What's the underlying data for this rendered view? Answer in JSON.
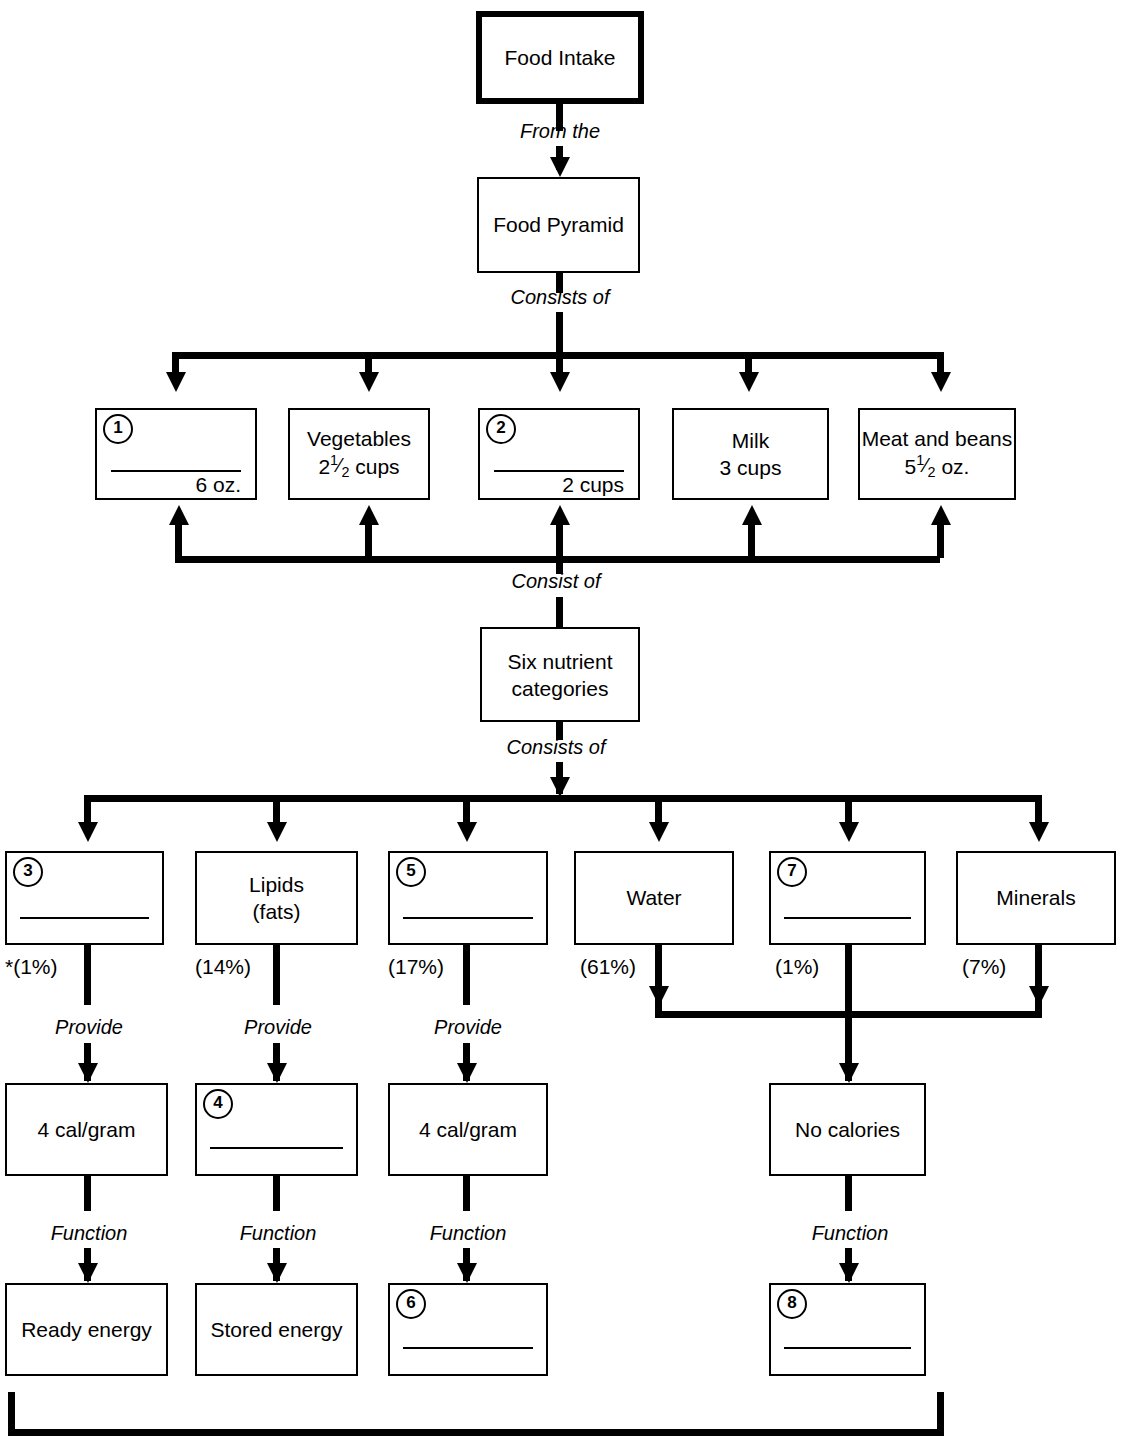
{
  "diagram": {
    "nodes": {
      "food_intake": "Food Intake",
      "food_pyramid": "Food Pyramid",
      "six_nutrient": "Six nutrient\ncategories",
      "six_nutrient_l1": "Six nutrient",
      "six_nutrient_l2": "categories"
    },
    "connector_labels": {
      "from_the": "From the",
      "consists_of_1": "Consists of",
      "consist_of_up": "Consist of",
      "consists_of_2": "Consists of",
      "provide_1": "Provide",
      "provide_2": "Provide",
      "provide_3": "Provide",
      "function_1": "Function",
      "function_2": "Function",
      "function_3": "Function",
      "function_4": "Function"
    },
    "food_groups": [
      {
        "num": "1",
        "label": "",
        "amount": "6 oz.",
        "blank": true
      },
      {
        "num": "",
        "label": "Vegetables",
        "amount": "2¹⁄₂ cups",
        "amount_whole": "2",
        "amount_num": "1",
        "amount_den": "2",
        "amount_unit": "cups",
        "blank": false
      },
      {
        "num": "2",
        "label": "",
        "amount": "2 cups",
        "blank": true
      },
      {
        "num": "",
        "label": "Milk",
        "amount": "3 cups",
        "blank": false
      },
      {
        "num": "",
        "label": "Meat and beans",
        "amount": "5¹⁄₂ oz.",
        "amount_whole": "5",
        "amount_num": "1",
        "amount_den": "2",
        "amount_unit": "oz.",
        "blank": false
      }
    ],
    "nutrients": [
      {
        "num": "3",
        "label": "",
        "label2": "",
        "percent": "*(1%)",
        "blank": true
      },
      {
        "num": "",
        "label": "Lipids",
        "label2": "(fats)",
        "percent": "(14%)",
        "blank": false
      },
      {
        "num": "5",
        "label": "",
        "label2": "",
        "percent": "(17%)",
        "blank": true
      },
      {
        "num": "",
        "label": "Water",
        "label2": "",
        "percent": "(61%)",
        "blank": false
      },
      {
        "num": "7",
        "label": "",
        "label2": "",
        "percent": "(1%)",
        "blank": true
      },
      {
        "num": "",
        "label": "Minerals",
        "label2": "",
        "percent": "(7%)",
        "blank": false
      }
    ],
    "energy_row": [
      {
        "num": "",
        "label": "4 cal/gram",
        "blank": false
      },
      {
        "num": "4",
        "label": "",
        "blank": true
      },
      {
        "num": "",
        "label": "4 cal/gram",
        "blank": false
      },
      {
        "num": "",
        "label": "No calories",
        "blank": false
      }
    ],
    "function_row": [
      {
        "num": "",
        "label": "Ready energy",
        "blank": false
      },
      {
        "num": "",
        "label": "Stored energy",
        "blank": false
      },
      {
        "num": "6",
        "label": "",
        "blank": true
      },
      {
        "num": "8",
        "label": "",
        "blank": true
      }
    ],
    "colors": {
      "ink": "#000000",
      "paper": "#ffffff"
    }
  }
}
